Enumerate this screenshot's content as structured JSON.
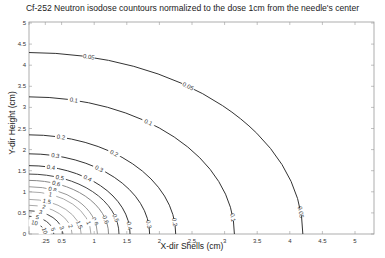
{
  "chart_data": {
    "type": "contour",
    "title": "Cf-252 Neutron isodose countours normalized to the dose 1cm from the needle's center",
    "xlabel": "X-dir Shells (cm)",
    "ylabel": "Y-dir Height (cm)",
    "xlim": [
      0,
      5.4
    ],
    "ylim": [
      0,
      5
    ],
    "x_ticks": [
      "0",
      ".25",
      "0.5",
      "1",
      "1.5",
      "2",
      "2.5",
      "3",
      "3.5",
      "4",
      "4.5",
      "5"
    ],
    "x_tick_values": [
      0,
      0.25,
      0.5,
      1,
      1.5,
      2,
      2.5,
      3,
      3.5,
      4,
      4.5,
      5
    ],
    "y_ticks": [
      "0",
      "0.5",
      "1",
      "1.5",
      "2",
      "2.5",
      "3",
      "3.5",
      "4",
      "4.5",
      "5"
    ],
    "y_tick_values": [
      0,
      0.5,
      1,
      1.5,
      2,
      2.5,
      3,
      3.5,
      4,
      4.5,
      5
    ],
    "grid": false,
    "legend": "none",
    "contours": [
      {
        "level": "0.05",
        "x_intercept": 4.2,
        "y_intercept": 4.3,
        "color": "#333333"
      },
      {
        "level": "0.1",
        "x_intercept": 3.15,
        "y_intercept": 3.25,
        "color": "#333333"
      },
      {
        "level": "0.2",
        "x_intercept": 2.25,
        "y_intercept": 2.35,
        "color": "#333333"
      },
      {
        "level": "0.3",
        "x_intercept": 1.85,
        "y_intercept": 1.9,
        "color": "#333333"
      },
      {
        "level": "0.4",
        "x_intercept": 1.55,
        "y_intercept": 1.62,
        "color": "#333333"
      },
      {
        "level": "0.5",
        "x_intercept": 1.38,
        "y_intercept": 1.42,
        "color": "#444444"
      },
      {
        "level": "0.6",
        "x_intercept": 1.22,
        "y_intercept": 1.27,
        "color": "#888888"
      },
      {
        "level": "0.8",
        "x_intercept": 1.05,
        "y_intercept": 1.12,
        "color": "#999999"
      },
      {
        "level": "1",
        "x_intercept": 0.95,
        "y_intercept": 1.0,
        "color": "#aaaaaa"
      },
      {
        "level": "1.5",
        "x_intercept": 0.8,
        "y_intercept": 0.82,
        "color": "#aaaaaa"
      },
      {
        "level": "2",
        "x_intercept": 0.66,
        "y_intercept": 0.68,
        "color": "#aaaaaa"
      },
      {
        "level": "3",
        "x_intercept": 0.52,
        "y_intercept": 0.55,
        "color": "#444444"
      },
      {
        "level": "5",
        "x_intercept": 0.38,
        "y_intercept": 0.42,
        "color": "#444444"
      },
      {
        "level": "10",
        "x_intercept": 0.25,
        "y_intercept": 0.28,
        "color": "#333333"
      }
    ]
  }
}
